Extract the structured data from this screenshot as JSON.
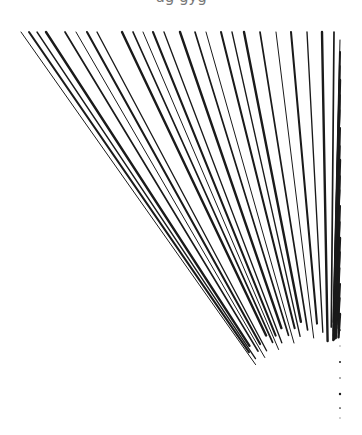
{
  "caption": {
    "text": "ug       gyg"
  },
  "illustration": {
    "type": "speed-lines-burst",
    "background": "#ffffff",
    "stroke_color": "#1a1a1a",
    "frame": {
      "left": 18,
      "top": 32,
      "right": 340,
      "bottom": 422
    },
    "focus": {
      "x": 330,
      "y": 470
    },
    "inner_radius": 140,
    "top_edge_x": [
      21,
      29,
      37,
      46,
      65,
      76,
      87,
      97,
      122,
      133,
      143,
      153,
      164,
      180,
      195,
      206,
      221,
      232,
      244,
      260,
      276,
      291,
      307,
      322,
      334
    ],
    "right_edge_y": [
      40,
      52,
      66,
      80,
      95,
      110,
      128,
      146,
      160,
      176,
      190,
      206,
      222,
      238,
      252,
      268,
      284,
      298,
      314,
      330,
      346,
      362,
      378,
      394,
      408,
      418
    ]
  }
}
